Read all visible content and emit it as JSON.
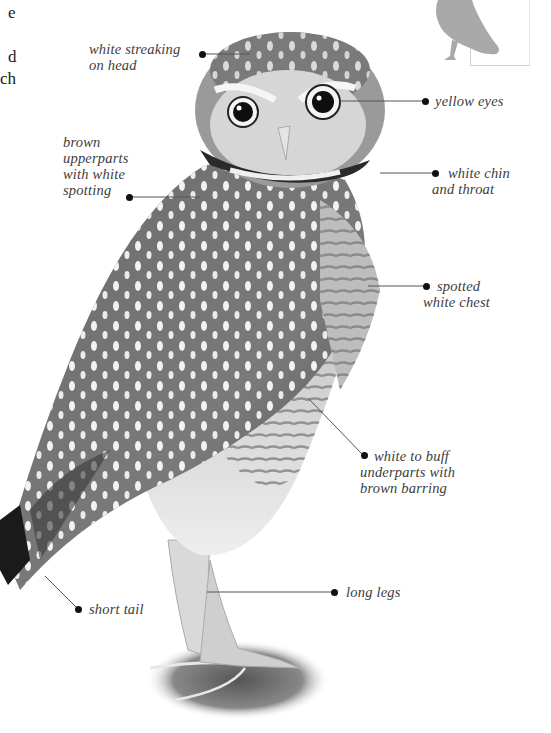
{
  "page": {
    "cut_off_text_lines": [
      "e",
      "",
      "d",
      "ch"
    ],
    "thumbnail": {
      "icon": "owl-silhouette-icon",
      "color": "#a9a9a9"
    }
  },
  "illustration": {
    "subject": "burrowing owl",
    "style": "grayscale engraving"
  },
  "callouts": [
    {
      "id": "head",
      "lines": [
        "white streaking",
        "on head"
      ]
    },
    {
      "id": "eyes",
      "lines": [
        "yellow eyes"
      ]
    },
    {
      "id": "upperparts",
      "lines": [
        "brown",
        "upperparts",
        "with white",
        "spotting"
      ]
    },
    {
      "id": "chin",
      "lines": [
        "white chin",
        "and throat"
      ]
    },
    {
      "id": "chest",
      "lines": [
        "spotted",
        "white chest"
      ]
    },
    {
      "id": "underparts",
      "lines": [
        "white to buff",
        "underparts with",
        "brown barring"
      ]
    },
    {
      "id": "tail",
      "lines": [
        "short tail"
      ]
    },
    {
      "id": "legs",
      "lines": [
        "long legs"
      ]
    }
  ]
}
